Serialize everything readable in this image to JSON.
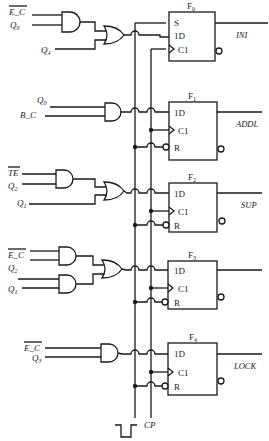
{
  "diagram": {
    "type": "sequential logic circuit (D flip-flop state controller)",
    "clock": {
      "label": "CP",
      "pulse_symbol": "negative-pulse"
    },
    "flip_flops": [
      {
        "name": "F0",
        "title_main": "F",
        "title_sub": "0",
        "pins": [
          "S",
          "1D",
          "C1"
        ],
        "output": "INI"
      },
      {
        "name": "F1",
        "title_main": "F",
        "title_sub": "1",
        "pins": [
          "1D",
          "C1",
          "R"
        ],
        "output": "ADDL"
      },
      {
        "name": "F2",
        "title_main": "F",
        "title_sub": "2",
        "pins": [
          "1D",
          "C1",
          "R"
        ],
        "output": "SUP"
      },
      {
        "name": "F3",
        "title_main": "F",
        "title_sub": "3",
        "pins": [
          "1D",
          "C1",
          "R"
        ],
        "output": ""
      },
      {
        "name": "F4",
        "title_main": "F",
        "title_sub": "4",
        "pins": [
          "1D",
          "C1",
          "R"
        ],
        "output": "LOCK"
      }
    ],
    "inputs": {
      "f0": [
        {
          "main": "E_C",
          "sub": "",
          "overline": true
        },
        {
          "main": "Q",
          "sub": "0",
          "overline": false
        },
        {
          "main": "Q",
          "sub": "4",
          "overline": false
        }
      ],
      "f1": [
        {
          "main": "Q",
          "sub": "0",
          "overline": false
        },
        {
          "main": "B_C",
          "sub": "",
          "overline": false
        }
      ],
      "f2": [
        {
          "main": "TE",
          "sub": "",
          "overline": true
        },
        {
          "main": "Q",
          "sub": "2",
          "overline": false
        },
        {
          "main": "Q",
          "sub": "1",
          "overline": false
        }
      ],
      "f3": [
        {
          "main": "E_C",
          "sub": "",
          "overline": true
        },
        {
          "main": "Q",
          "sub": "2",
          "overline": false
        },
        {
          "main": "Q",
          "sub": "1",
          "overline": false
        }
      ],
      "f4": [
        {
          "main": "E_C",
          "sub": "",
          "overline": true
        },
        {
          "main": "Q",
          "sub": "3",
          "overline": false
        }
      ]
    },
    "gates": [
      {
        "id": "and0",
        "type": "AND",
        "inputs": [
          "E_C(bar)",
          "Q0"
        ]
      },
      {
        "id": "or0",
        "type": "OR",
        "inputs": [
          "and0",
          "Q4"
        ],
        "drives": "F0.1D"
      },
      {
        "id": "and1",
        "type": "AND",
        "inputs": [
          "Q0",
          "B_C"
        ],
        "drives": "F1.1D"
      },
      {
        "id": "and2",
        "type": "AND",
        "inputs": [
          "TE(bar)",
          "Q2"
        ]
      },
      {
        "id": "or2",
        "type": "OR",
        "inputs": [
          "and2",
          "Q1"
        ],
        "drives": "F2.1D"
      },
      {
        "id": "and3a",
        "type": "AND",
        "inputs": [
          "E_C(bar)",
          "Q2"
        ]
      },
      {
        "id": "and3b",
        "type": "AND",
        "inputs": [
          "(unlabeled)",
          "Q1"
        ]
      },
      {
        "id": "or3",
        "type": "OR",
        "inputs": [
          "and3a",
          "and3b"
        ],
        "drives": "F3.1D"
      },
      {
        "id": "and4",
        "type": "AND",
        "inputs": [
          "E_C(bar)",
          "Q3"
        ],
        "drives": "F4.1D"
      }
    ]
  }
}
